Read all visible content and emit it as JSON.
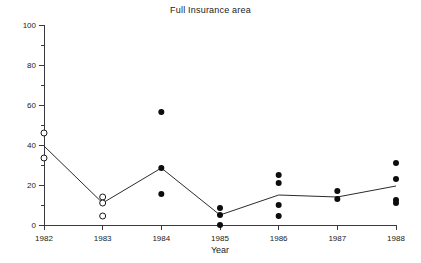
{
  "chart_data": {
    "type": "scatter",
    "title": "Full Insurance area",
    "xlabel": "Year",
    "ylabel": "",
    "categories": [
      "1982",
      "1983",
      "1984",
      "1985",
      "1986",
      "1987",
      "1988"
    ],
    "x": [
      1982,
      1983,
      1984,
      1985,
      1986,
      1987,
      1988
    ],
    "xlim": [
      1982,
      1988
    ],
    "ylim": [
      0,
      100
    ],
    "ytick_labels": [
      "0",
      "20",
      "40",
      "60",
      "80",
      "100"
    ],
    "ytick_values": [
      0,
      20,
      40,
      60,
      80,
      100
    ],
    "yminor_values": [
      10,
      30,
      50,
      70,
      90
    ],
    "grid": false,
    "legend": "none",
    "series": [
      {
        "name": "Observations (open markers)",
        "marker": "open-circle",
        "points": [
          {
            "x": 1982,
            "y": 46
          },
          {
            "x": 1982,
            "y": 33.5
          },
          {
            "x": 1983,
            "y": 14
          },
          {
            "x": 1983,
            "y": 11
          },
          {
            "x": 1983,
            "y": 4.5
          }
        ]
      },
      {
        "name": "Observations (filled markers)",
        "marker": "filled-circle",
        "points": [
          {
            "x": 1984,
            "y": 56.5
          },
          {
            "x": 1984,
            "y": 28.5
          },
          {
            "x": 1984,
            "y": 15.5
          },
          {
            "x": 1985,
            "y": 8.5
          },
          {
            "x": 1985,
            "y": 5
          },
          {
            "x": 1985,
            "y": 0
          },
          {
            "x": 1986,
            "y": 25
          },
          {
            "x": 1986,
            "y": 21
          },
          {
            "x": 1986,
            "y": 10
          },
          {
            "x": 1986,
            "y": 4.5
          },
          {
            "x": 1987,
            "y": 17
          },
          {
            "x": 1987,
            "y": 13
          },
          {
            "x": 1988,
            "y": 31
          },
          {
            "x": 1988,
            "y": 23
          },
          {
            "x": 1988,
            "y": 12.5
          },
          {
            "x": 1988,
            "y": 11
          }
        ]
      },
      {
        "name": "Mean trend",
        "marker": "line",
        "values": [
          39.5,
          11,
          28.5,
          5,
          15,
          14,
          19.5
        ]
      }
    ]
  },
  "layout": {
    "plot_left": 44,
    "plot_right": 396,
    "plot_top": 25,
    "plot_bottom": 225,
    "marker_radius_filled": 3,
    "marker_radius_open": 3
  },
  "colors": {
    "axis": "#3a3a3a",
    "text": "#1a1a1a",
    "line": "#2b2b2b",
    "marker_fill": "#0d0d0d",
    "marker_open_fill": "#ffffff",
    "background": "#ffffff"
  }
}
